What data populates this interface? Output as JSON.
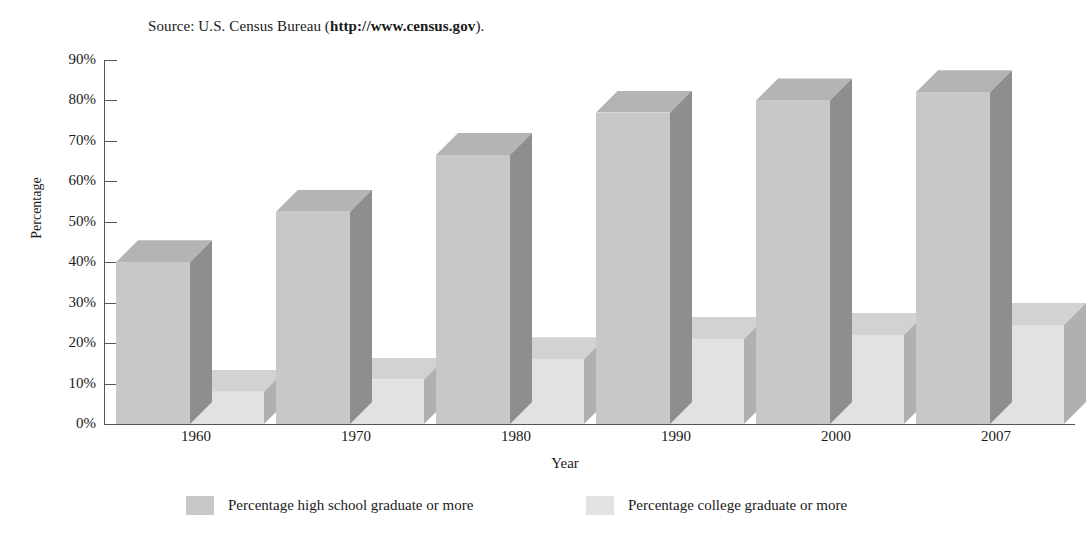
{
  "source_note": {
    "prefix": "Source: U.S. Census Bureau (",
    "url": "http://www.census.gov",
    "suffix": ")."
  },
  "chart_data": {
    "type": "bar",
    "title": "",
    "xlabel": "Year",
    "ylabel": "Percentage",
    "categories": [
      "1960",
      "1970",
      "1980",
      "1990",
      "2000",
      "2007"
    ],
    "series": [
      {
        "name": "Percentage high school graduate or more",
        "color": "#c8c8c8",
        "side_color": "#8e8e8e",
        "top_color": "#b4b4b4",
        "values": [
          40,
          52.5,
          66.5,
          77,
          80,
          82
        ]
      },
      {
        "name": "Percentage college graduate or more",
        "color": "#e2e2e2",
        "side_color": "#b0b0b0",
        "top_color": "#d2d2d2",
        "values": [
          8,
          11,
          16,
          21,
          22,
          24.5
        ]
      }
    ],
    "ylim": [
      0,
      90
    ],
    "ytick_step": 10,
    "ytick_labels": [
      "0%",
      "10%",
      "20%",
      "30%",
      "40%",
      "50%",
      "60%",
      "70%",
      "80%",
      "90%"
    ],
    "grid": false,
    "legend_position": "bottom",
    "axis_color": "#555555"
  }
}
